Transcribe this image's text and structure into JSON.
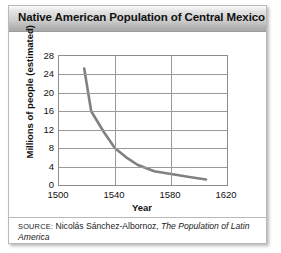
{
  "figure": {
    "title": "Native American Population of Central Mexico",
    "source": {
      "label": "SOURCE:",
      "author": "Nicolás Sánchez-Albornoz,",
      "work": "The Population of Latin America"
    }
  },
  "chart_data": {
    "type": "line",
    "title": "Native American Population of Central Mexico",
    "xlabel": "Year",
    "ylabel": "Millions of people (estimated)",
    "xlim": [
      1500,
      1620
    ],
    "ylim": [
      0,
      28
    ],
    "xticks": [
      1500,
      1540,
      1580,
      1620
    ],
    "yticks": [
      0,
      4,
      8,
      12,
      16,
      20,
      24,
      28
    ],
    "grid": true,
    "legend": "none",
    "line_color": "#808080",
    "x": [
      1518,
      1523,
      1532,
      1540,
      1548,
      1556,
      1568,
      1580,
      1592,
      1605
    ],
    "values": [
      25.3,
      16.0,
      11.5,
      8.0,
      6.0,
      4.4,
      3.0,
      2.4,
      1.8,
      1.2
    ],
    "series": [
      {
        "name": "Native American population of Central Mexico",
        "x": [
          1518,
          1523,
          1532,
          1540,
          1548,
          1556,
          1568,
          1580,
          1592,
          1605
        ],
        "values": [
          25.3,
          16.0,
          11.5,
          8.0,
          6.0,
          4.4,
          3.0,
          2.4,
          1.8,
          1.2
        ]
      }
    ]
  }
}
